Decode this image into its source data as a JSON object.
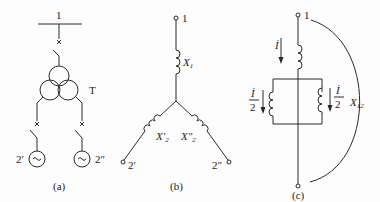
{
  "figure": {
    "panels": [
      {
        "id": "a",
        "caption": "(a)",
        "busbar_label": "1",
        "transformer_label": "T",
        "generator_left_label": "2′",
        "generator_right_label": "2″",
        "generator_symbol": "~"
      },
      {
        "id": "b",
        "caption": "(b)",
        "terminal_top_label": "1",
        "reactance_1": {
          "main": "X",
          "sub": "1"
        },
        "reactance_2_left": {
          "main": "X′",
          "sub": "2"
        },
        "reactance_2_right": {
          "main": "X″",
          "sub": "2"
        },
        "terminal_left_label": "2′",
        "terminal_right_label": "2″"
      },
      {
        "id": "c",
        "caption": "(c)",
        "terminal_top_label": "1",
        "current_total": "İ",
        "current_half_num": "İ",
        "current_half_den": "2",
        "reactance_12": {
          "main": "X",
          "sub": "12"
        }
      }
    ],
    "colors": {
      "line": "#2a2a2a",
      "background": "#fdfdfd"
    }
  }
}
